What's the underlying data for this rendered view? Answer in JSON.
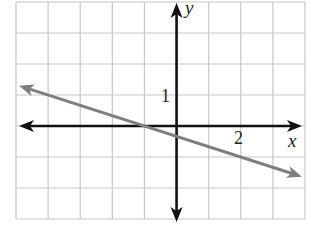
{
  "chart_data": {
    "type": "line",
    "title": "",
    "xlabel": "x",
    "ylabel": "y",
    "xlim": [
      -5,
      4
    ],
    "ylim": [
      -3,
      4
    ],
    "grid": true,
    "grid_step": 1,
    "tick_labels": {
      "x": [
        "2"
      ],
      "y": [
        "1"
      ]
    },
    "series": [
      {
        "name": "line",
        "equation": "y = -x/3 - 1/3",
        "x": [
          -5,
          -1,
          2,
          4
        ],
        "y": [
          1.333,
          0,
          -1,
          -1.667
        ],
        "color": "#7f7f7f",
        "arrows": "both"
      }
    ]
  },
  "labels": {
    "x_axis": "x",
    "y_axis": "y",
    "x_tick": "2",
    "y_tick": "1"
  },
  "colors": {
    "grid": "#c8c8c8",
    "axis": "#111111",
    "line": "#7f7f7f"
  }
}
